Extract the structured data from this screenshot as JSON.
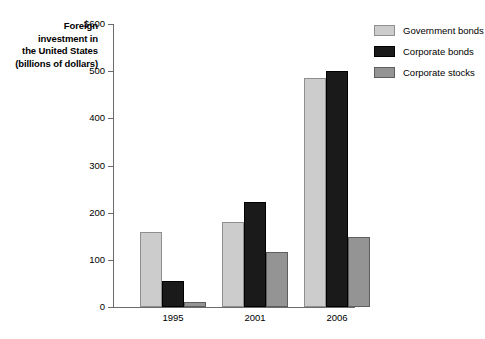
{
  "axis_title_lines": [
    "Foreign",
    "investment in",
    "the United States",
    "(billions of dollars)"
  ],
  "legend": {
    "items": [
      {
        "label": "Government bonds",
        "color": "#cccccc",
        "swatch_name": "legend-swatch-government-bonds"
      },
      {
        "label": "Corporate bonds",
        "color": "#1a1a1a",
        "swatch_name": "legend-swatch-corporate-bonds"
      },
      {
        "label": "Corporate stocks",
        "color": "#949494",
        "swatch_name": "legend-swatch-corporate-stocks"
      }
    ]
  },
  "chart_data": {
    "type": "bar",
    "title": "Foreign investment in the United States (billions of dollars)",
    "xlabel": "",
    "ylabel": "Foreign investment in the United States (billions of dollars)",
    "ylim": [
      0,
      600
    ],
    "yticks": [
      0,
      100,
      200,
      300,
      400,
      500,
      600
    ],
    "ytick_labels": [
      "0",
      "100",
      "200",
      "300",
      "400",
      "500",
      "$600"
    ],
    "grid": false,
    "legend_position": "right",
    "categories": [
      "1995",
      "2001",
      "2006"
    ],
    "series": [
      {
        "name": "Government bonds",
        "color": "#cccccc",
        "values": [
          160,
          180,
          485
        ]
      },
      {
        "name": "Corporate bonds",
        "color": "#1a1a1a",
        "values": [
          55,
          222,
          500
        ]
      },
      {
        "name": "Corporate stocks",
        "color": "#949494",
        "values": [
          10,
          117,
          148
        ]
      }
    ]
  }
}
